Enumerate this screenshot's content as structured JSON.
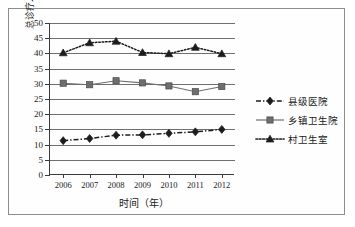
{
  "chart_data": {
    "type": "line",
    "title": "",
    "xlabel": "时间（年）",
    "ylabel": "总诊疗人次数占农村地区比重（%）",
    "categories": [
      "2006",
      "2007",
      "2008",
      "2009",
      "2010",
      "2011",
      "2012"
    ],
    "x": [
      2006,
      2007,
      2008,
      2009,
      2010,
      2011,
      2012
    ],
    "ylim": [
      0,
      50
    ],
    "yticks": [
      0,
      5,
      10,
      15,
      20,
      25,
      30,
      35,
      40,
      45,
      50
    ],
    "grid": "horizontal",
    "legend_position": "right",
    "series": [
      {
        "name": "县级医院",
        "values": [
          11.3,
          12.0,
          13.1,
          13.2,
          13.7,
          14.2,
          15.0
        ],
        "marker": "diamond",
        "line_style": "dash-dot",
        "color": "#1c1c1c"
      },
      {
        "name": "乡镇卫生院",
        "values": [
          30.2,
          29.7,
          31.0,
          30.3,
          29.3,
          27.4,
          29.1
        ],
        "marker": "square",
        "line_style": "solid",
        "color": "#6e6e6e"
      },
      {
        "name": "村卫生室",
        "values": [
          40.2,
          43.5,
          44.0,
          40.3,
          39.9,
          42.0,
          39.9
        ],
        "marker": "triangle",
        "line_style": "dotted",
        "color": "#1c1c1c"
      }
    ]
  },
  "axes": {
    "ytick_labels": [
      "0",
      "5",
      "10",
      "15",
      "20",
      "25",
      "30",
      "35",
      "40",
      "45",
      "50"
    ],
    "xtick_labels": [
      "2006",
      "2007",
      "2008",
      "2009",
      "2010",
      "2011",
      "2012"
    ]
  },
  "legend": {
    "items": [
      {
        "label": "县级医院"
      },
      {
        "label": "乡镇卫生院"
      },
      {
        "label": "村卫生室"
      }
    ]
  },
  "colors": {
    "axis": "#3a3a3a",
    "grid": "#6f6f6f",
    "frame": "#8d8d8d",
    "series_dark": "#1c1c1c",
    "series_gray": "#6e6e6e",
    "background": "#fefefe"
  }
}
